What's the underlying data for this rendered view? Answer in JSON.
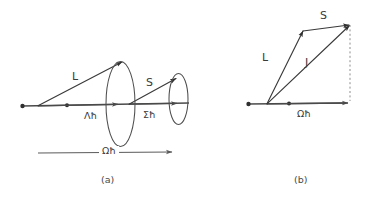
{
  "figure": {
    "background_color": "#ffffff",
    "line_color": "#3a3a3a",
    "width": 377,
    "height": 197
  },
  "panel_a": {
    "caption": "(a)",
    "vectors": [
      {
        "name": "L",
        "label": "L"
      },
      {
        "name": "S",
        "label": "S"
      }
    ],
    "projections": [
      {
        "name": "lambda-h-bar",
        "label": "Λħ"
      },
      {
        "name": "sigma-h-bar",
        "label": "Σħ"
      }
    ],
    "resultant": {
      "name": "omega-h-bar",
      "label": "Ωħ"
    },
    "cones": [
      {
        "name": "large-precession-cone"
      },
      {
        "name": "small-precession-cone"
      }
    ]
  },
  "panel_b": {
    "caption": "(b)",
    "vectors": [
      {
        "name": "L",
        "label": "L"
      },
      {
        "name": "S",
        "label": "S"
      },
      {
        "name": "J",
        "label": "J"
      }
    ],
    "projections": [
      {
        "name": "omega-h-bar",
        "label": "Ωħ"
      }
    ]
  }
}
